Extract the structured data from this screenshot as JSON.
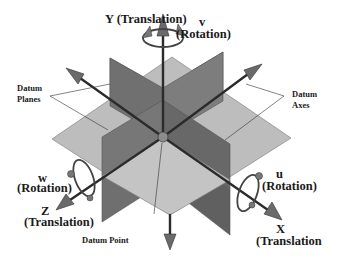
{
  "diagram": {
    "type": "3d-coordinate-datum-diagram",
    "labels": {
      "y_translation": "Y (Translation)",
      "v_letter": "v",
      "v_rotation": "(Rotation)",
      "datum_planes_1": "Datum",
      "datum_planes_2": "Planes",
      "datum_axes_1": "Datum",
      "datum_axes_2": "Axes",
      "w_letter": "w",
      "w_rotation": "(Rotation)",
      "z_letter": "Z",
      "z_translation": "(Translation)",
      "u_letter": "u",
      "u_rotation": "(Rotation)",
      "x_letter": "X",
      "x_translation": "(Translation",
      "datum_point": "Datum Point"
    },
    "colors": {
      "horizontal_plane": "#bdbdbd",
      "vertical_plane": "#6f6f6f",
      "vertical_plane_light": "#8a8a8a",
      "axis": "#2b2b2b",
      "arrow_head": "#6a6a6a",
      "datum_point": "#8c8c8c",
      "text": "#1a1a1a"
    }
  }
}
